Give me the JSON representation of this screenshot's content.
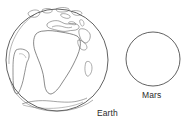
{
  "figure": {
    "kind": "line-drawing-diagram",
    "background_color": "#ffffff",
    "stroke_color": "#3a3a3a",
    "text_color": "#2b2b2b"
  },
  "objects": [
    {
      "id": "earth",
      "label": "Earth",
      "shape": "circle",
      "filled": false,
      "has_surface_detail": true,
      "surface_features": [
        "Africa",
        "Europe",
        "Mediterranean Sea",
        "Arabian Peninsula",
        "South America",
        "Madagascar",
        "Antarctica",
        "Greenland"
      ],
      "center": {
        "x": 57,
        "y": 60
      },
      "radius": 51,
      "label_position": {
        "x": 97,
        "y": 108
      }
    },
    {
      "id": "mars",
      "label": "Mars",
      "shape": "circle",
      "filled": false,
      "has_surface_detail": false,
      "surface_features": [],
      "center": {
        "x": 153,
        "y": 59
      },
      "radius": 27,
      "label_position": {
        "x": 142,
        "y": 90
      }
    }
  ],
  "labels": {
    "earth": "Earth",
    "mars": "Mars"
  }
}
